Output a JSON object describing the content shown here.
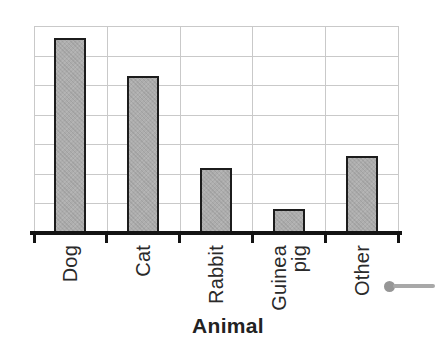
{
  "chart_data": {
    "type": "bar",
    "title": "",
    "xlabel": "Animal",
    "ylabel": "",
    "categories": [
      "Dog",
      "Cat",
      "Rabbit",
      "Guinea\npig",
      "Other"
    ],
    "values": [
      6.6,
      5.3,
      2.2,
      0.8,
      2.6
    ],
    "value_scale": "gridline units (y-axis has gridlines but no tick labels)",
    "ylim": [
      0,
      7
    ],
    "grid": "on",
    "legend": "none",
    "bar_label_rotation": -90
  },
  "annotations": {
    "callout_pointer": "gray dot with leader line extending to the right edge, beside the Other label"
  },
  "colors": {
    "background": "#ffffff",
    "bar_fill": "#adadad",
    "bar_border": "#1c1c1c",
    "gridline": "#c9c9c9",
    "axis": "#141414",
    "label_text": "#2a2a2a",
    "callout_gray": "#9b9b9b"
  }
}
